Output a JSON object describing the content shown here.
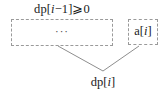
{
  "diagram": {
    "type": "dynamic-programming-recurrence-diagram",
    "condition": {
      "label": "dp[i−1]⩾0",
      "meaning": "dp[i-1] >= 0"
    },
    "nodes": [
      {
        "id": "prefix",
        "name": "prefix-subarray-box",
        "text": "···",
        "style": "dashed-rectangle",
        "x": 11,
        "y": 19,
        "width": 102,
        "height": 27
      },
      {
        "id": "element",
        "name": "current-element-box",
        "text": "a[i]",
        "style": "dashed-rectangle",
        "x": 128,
        "y": 19,
        "width": 30,
        "height": 26
      }
    ],
    "result": {
      "label": "dp[i]",
      "x": 103,
      "y": 83
    },
    "connectors": [
      {
        "from": "prefix",
        "to": "result",
        "x1": 58,
        "y1": 46,
        "x2": 103,
        "y2": 71
      },
      {
        "from": "element",
        "to": "result",
        "x1": 139,
        "y1": 46,
        "x2": 103,
        "y2": 71
      }
    ],
    "colors": {
      "background": "#ffffff",
      "text": "#1a1a1a",
      "border": "#9a9a9a",
      "connector": "#8e8e8e"
    }
  }
}
